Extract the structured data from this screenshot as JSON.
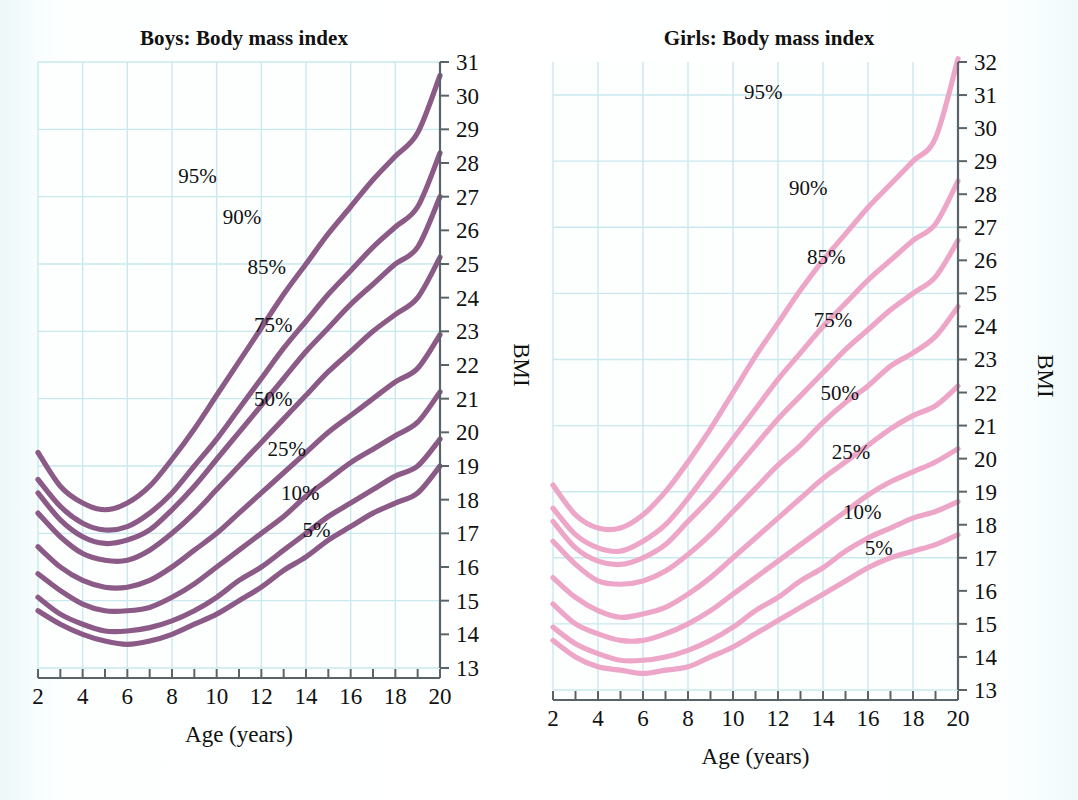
{
  "page": {
    "background_color": "#f4fbfb",
    "grid_color": "#c9e9ee",
    "axis_color": "#5a6468",
    "text_color": "#111111"
  },
  "charts": [
    {
      "id": "boys",
      "title": "Boys: Body mass index",
      "xlabel": "Age (years)",
      "ylabel": "BMI",
      "line_color": "#8b5a87",
      "chart_data": {
        "type": "line",
        "title": "Boys: Body mass index",
        "xlabel": "Age (years)",
        "ylabel": "BMI",
        "xlim": [
          2,
          20
        ],
        "ylim": [
          13,
          31
        ],
        "x_tick_step": 1,
        "x_label_step": 2,
        "y_tick_step": 1,
        "y_label_step": 1,
        "grid": true,
        "grid_x_step": 2,
        "grid_y_step": 2,
        "x_ticks": [
          2,
          3,
          4,
          5,
          6,
          7,
          8,
          9,
          10,
          11,
          12,
          13,
          14,
          15,
          16,
          17,
          18,
          19,
          20
        ],
        "x_tick_labels": [
          "2",
          "",
          "4",
          "",
          "6",
          "",
          "8",
          "",
          "10",
          "",
          "12",
          "",
          "14",
          "",
          "16",
          "",
          "18",
          "",
          "20"
        ],
        "y_ticks": [
          13,
          14,
          15,
          16,
          17,
          18,
          19,
          20,
          21,
          22,
          23,
          24,
          25,
          26,
          27,
          28,
          29,
          30,
          31
        ],
        "y_tick_labels": [
          "13",
          "14",
          "15",
          "16",
          "17",
          "18",
          "19",
          "20",
          "21",
          "22",
          "23",
          "24",
          "25",
          "26",
          "27",
          "28",
          "29",
          "30",
          "31"
        ],
        "legend_position": "inline-annotations",
        "x": [
          2,
          3,
          4,
          5,
          6,
          7,
          8,
          9,
          10,
          11,
          12,
          13,
          14,
          15,
          16,
          17,
          18,
          19,
          20
        ],
        "series": [
          {
            "name": "95%",
            "label": "95%",
            "label_x": 10.0,
            "label_y": 27.6,
            "values": [
              19.4,
              18.4,
              17.9,
              17.7,
              17.9,
              18.4,
              19.2,
              20.1,
              21.1,
              22.1,
              23.1,
              24.1,
              25.0,
              25.9,
              26.7,
              27.5,
              28.2,
              28.9,
              30.6
            ]
          },
          {
            "name": "90%",
            "label": "90%",
            "label_x": 12.0,
            "label_y": 26.4,
            "values": [
              18.6,
              17.8,
              17.3,
              17.1,
              17.2,
              17.6,
              18.2,
              19.0,
              19.8,
              20.7,
              21.6,
              22.5,
              23.3,
              24.1,
              24.8,
              25.5,
              26.1,
              26.7,
              28.3
            ]
          },
          {
            "name": "85%",
            "label": "85%",
            "label_x": 13.1,
            "label_y": 24.9,
            "values": [
              18.2,
              17.4,
              16.9,
              16.7,
              16.8,
              17.1,
              17.7,
              18.4,
              19.2,
              20.0,
              20.8,
              21.6,
              22.4,
              23.1,
              23.8,
              24.4,
              25.0,
              25.5,
              27.0
            ]
          },
          {
            "name": "75%",
            "label": "75%",
            "label_x": 13.4,
            "label_y": 23.2,
            "values": [
              17.6,
              16.9,
              16.4,
              16.2,
              16.2,
              16.5,
              17.0,
              17.6,
              18.3,
              19.0,
              19.7,
              20.4,
              21.1,
              21.8,
              22.4,
              23.0,
              23.5,
              24.0,
              25.2
            ]
          },
          {
            "name": "50%",
            "label": "50%",
            "label_x": 13.4,
            "label_y": 21.0,
            "values": [
              16.6,
              16.0,
              15.6,
              15.4,
              15.4,
              15.6,
              16.0,
              16.5,
              17.0,
              17.6,
              18.2,
              18.8,
              19.4,
              20.0,
              20.5,
              21.0,
              21.5,
              21.9,
              22.9
            ]
          },
          {
            "name": "25%",
            "label": "25%",
            "label_x": 14.0,
            "label_y": 19.5,
            "values": [
              15.8,
              15.3,
              14.9,
              14.7,
              14.7,
              14.8,
              15.1,
              15.5,
              16.0,
              16.5,
              17.0,
              17.5,
              18.1,
              18.6,
              19.1,
              19.5,
              19.9,
              20.3,
              21.2
            ]
          },
          {
            "name": "10%",
            "label": "10%",
            "label_x": 14.6,
            "label_y": 18.2,
            "values": [
              15.1,
              14.6,
              14.3,
              14.1,
              14.1,
              14.2,
              14.4,
              14.7,
              15.1,
              15.6,
              16.0,
              16.5,
              17.0,
              17.5,
              17.9,
              18.3,
              18.7,
              19.0,
              19.8
            ]
          },
          {
            "name": "5%",
            "label": "5%",
            "label_x": 15.1,
            "label_y": 17.1,
            "values": [
              14.7,
              14.3,
              14.0,
              13.8,
              13.7,
              13.8,
              14.0,
              14.3,
              14.6,
              15.0,
              15.4,
              15.9,
              16.3,
              16.8,
              17.2,
              17.6,
              17.9,
              18.2,
              19.0
            ]
          }
        ]
      }
    },
    {
      "id": "girls",
      "title": "Girls: Body mass index",
      "xlabel": "Age (years)",
      "ylabel": "BMI",
      "line_color": "#eda6c8",
      "chart_data": {
        "type": "line",
        "title": "Girls: Body mass index",
        "xlabel": "Age (years)",
        "ylabel": "BMI",
        "xlim": [
          2,
          20
        ],
        "ylim": [
          13,
          32
        ],
        "x_tick_step": 1,
        "x_label_step": 2,
        "y_tick_step": 1,
        "y_label_step": 1,
        "grid": true,
        "grid_x_step": 2,
        "grid_y_step": 2,
        "x_ticks": [
          2,
          3,
          4,
          5,
          6,
          7,
          8,
          9,
          10,
          11,
          12,
          13,
          14,
          15,
          16,
          17,
          18,
          19,
          20
        ],
        "x_tick_labels": [
          "2",
          "",
          "4",
          "",
          "6",
          "",
          "8",
          "",
          "10",
          "",
          "12",
          "",
          "14",
          "",
          "16",
          "",
          "18",
          "",
          "20"
        ],
        "y_ticks": [
          13,
          14,
          15,
          16,
          17,
          18,
          19,
          20,
          21,
          22,
          23,
          24,
          25,
          26,
          27,
          28,
          29,
          30,
          31,
          32
        ],
        "y_tick_labels": [
          "13",
          "14",
          "15",
          "16",
          "17",
          "18",
          "19",
          "20",
          "21",
          "22",
          "23",
          "24",
          "25",
          "26",
          "27",
          "28",
          "29",
          "30",
          "31",
          "32"
        ],
        "legend_position": "inline-annotations",
        "x": [
          2,
          3,
          4,
          5,
          6,
          7,
          8,
          9,
          10,
          11,
          12,
          13,
          14,
          15,
          16,
          17,
          18,
          19,
          20
        ],
        "series": [
          {
            "name": "95%",
            "label": "95%",
            "label_x": 12.2,
            "label_y": 31.1,
            "values": [
              19.2,
              18.3,
              17.9,
              17.9,
              18.3,
              19.0,
              19.9,
              20.9,
              22.0,
              23.1,
              24.1,
              25.1,
              26.0,
              26.8,
              27.6,
              28.3,
              29.0,
              29.7,
              32.1
            ]
          },
          {
            "name": "90%",
            "label": "90%",
            "label_x": 14.2,
            "label_y": 28.2,
            "values": [
              18.5,
              17.7,
              17.3,
              17.2,
              17.5,
              18.0,
              18.8,
              19.7,
              20.6,
              21.5,
              22.4,
              23.2,
              24.0,
              24.7,
              25.4,
              26.0,
              26.6,
              27.1,
              28.4
            ]
          },
          {
            "name": "85%",
            "label": "85%",
            "label_x": 15.0,
            "label_y": 26.1,
            "values": [
              18.1,
              17.3,
              16.9,
              16.8,
              17.0,
              17.4,
              18.1,
              18.8,
              19.6,
              20.4,
              21.2,
              21.9,
              22.6,
              23.3,
              23.9,
              24.5,
              25.0,
              25.5,
              26.6
            ]
          },
          {
            "name": "75%",
            "label": "75%",
            "label_x": 15.3,
            "label_y": 24.2,
            "values": [
              17.5,
              16.8,
              16.3,
              16.2,
              16.3,
              16.6,
              17.1,
              17.7,
              18.4,
              19.1,
              19.8,
              20.4,
              21.1,
              21.7,
              22.2,
              22.8,
              23.2,
              23.7,
              24.6
            ]
          },
          {
            "name": "50%",
            "label": "50%",
            "label_x": 15.6,
            "label_y": 22.0,
            "values": [
              16.4,
              15.8,
              15.4,
              15.2,
              15.3,
              15.5,
              15.9,
              16.4,
              17.0,
              17.6,
              18.2,
              18.8,
              19.4,
              19.9,
              20.4,
              20.9,
              21.3,
              21.6,
              22.2
            ]
          },
          {
            "name": "25%",
            "label": "25%",
            "label_x": 16.1,
            "label_y": 20.2,
            "values": [
              15.6,
              15.0,
              14.7,
              14.5,
              14.5,
              14.7,
              15.0,
              15.4,
              15.9,
              16.4,
              16.9,
              17.4,
              17.9,
              18.4,
              18.9,
              19.3,
              19.6,
              19.9,
              20.3
            ]
          },
          {
            "name": "10%",
            "label": "10%",
            "label_x": 16.6,
            "label_y": 18.4,
            "values": [
              14.9,
              14.4,
              14.1,
              13.9,
              13.9,
              14.0,
              14.2,
              14.5,
              14.9,
              15.4,
              15.8,
              16.3,
              16.7,
              17.2,
              17.6,
              17.9,
              18.2,
              18.4,
              18.7
            ]
          },
          {
            "name": "5%",
            "label": "5%",
            "label_x": 17.1,
            "label_y": 17.3,
            "values": [
              14.5,
              14.0,
              13.7,
              13.6,
              13.5,
              13.6,
              13.7,
              14.0,
              14.3,
              14.7,
              15.1,
              15.5,
              15.9,
              16.3,
              16.7,
              17.0,
              17.2,
              17.4,
              17.7
            ]
          }
        ]
      }
    }
  ]
}
